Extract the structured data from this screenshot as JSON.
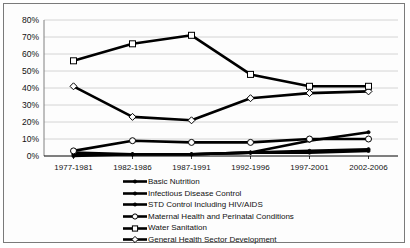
{
  "chart_data": {
    "type": "line",
    "title": "",
    "xlabel": "",
    "ylabel": "",
    "ylim": [
      0,
      80
    ],
    "yticks": [
      "0%",
      "10%",
      "20%",
      "30%",
      "40%",
      "50%",
      "60%",
      "70%",
      "80%"
    ],
    "grid": true,
    "legend_position": "bottom",
    "categories": [
      "1977-1981",
      "1982-1986",
      "1987-1991",
      "1992-1996",
      "1997-2001",
      "2002-2006"
    ],
    "series": [
      {
        "name": "Basic Nutrition",
        "marker": "dot",
        "values": [
          1,
          1,
          1,
          2,
          2,
          3
        ]
      },
      {
        "name": "Infectious Disease Control",
        "marker": "dot",
        "values": [
          2,
          1,
          1,
          2,
          9,
          14
        ]
      },
      {
        "name": "STD Control Including HIV/AIDS",
        "marker": "dot",
        "values": [
          0,
          1,
          1,
          2,
          3,
          4
        ]
      },
      {
        "name": "Maternal Health and Perinatal Conditions",
        "marker": "open-circle",
        "values": [
          3,
          9,
          8,
          8,
          10,
          10
        ]
      },
      {
        "name": "Water Sanitation",
        "marker": "open-square",
        "values": [
          56,
          66,
          71,
          48,
          41,
          41
        ]
      },
      {
        "name": "General Health Sector Development",
        "marker": "open-diamond",
        "values": [
          41,
          23,
          21,
          34,
          37,
          38
        ]
      }
    ]
  },
  "colors": {
    "line": "#000000",
    "grid": "#c9c9c9",
    "axis": "#808080",
    "frame": "#7a7a7a",
    "background": "#ffffff",
    "marker_fill": "#ffffff"
  }
}
